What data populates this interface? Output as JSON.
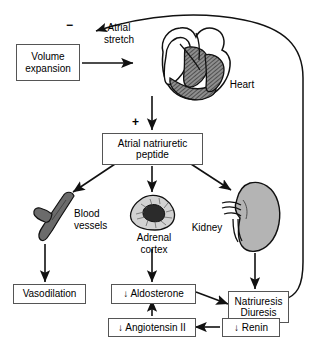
{
  "diagram": {
    "type": "physiology-flow-diagram",
    "boxes": {
      "volume_expansion": "Volume\nexpansion",
      "volume_expansion_line1": "Volume",
      "volume_expansion_line2": "expansion",
      "anp_line1": "Atrial natriuretic",
      "anp_line2": "peptide",
      "vasodilation": "Vasodilation",
      "aldosterone": "↓ Aldosterone",
      "natriuresis_line1": "Natriuresis",
      "natriuresis_line2": "Diuresis",
      "angiotensin": "↓ Angiotensin II",
      "renin": "↓ Renin"
    },
    "labels": {
      "atrial_stretch_line1": "Atrial",
      "atrial_stretch_line2": "stretch",
      "heart": "Heart",
      "blood_vessels_line1": "Blood",
      "blood_vessels_line2": "vessels",
      "adrenal_line1": "Adrenal",
      "adrenal_line2": "cortex",
      "kidney": "Kidney"
    },
    "signs": {
      "negative_feedback": "−",
      "stimulation": "+"
    },
    "organs": [
      {
        "name": "heart-illustration",
        "label": "Heart"
      },
      {
        "name": "blood-vessel-illustration",
        "label": "Blood vessels"
      },
      {
        "name": "adrenal-cortex-illustration",
        "label": "Adrenal cortex"
      },
      {
        "name": "kidney-illustration",
        "label": "Kidney"
      }
    ],
    "colors": {
      "stroke": "#1a1a1a",
      "box_border": "#555555",
      "organ_gray": "#a8a8a8",
      "organ_dark": "#5a5a5a",
      "background": "#ffffff"
    }
  }
}
